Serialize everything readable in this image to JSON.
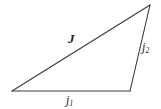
{
  "figure": {
    "kind": "geometry-diagram",
    "background_color": "#ffffff",
    "stroke_color": "#3a3a3a",
    "text_color": "#1d1d1d",
    "width": 161,
    "height": 109
  },
  "triangle": {
    "vertices": {
      "left": {
        "x": 12,
        "y": 91
      },
      "apex": {
        "x": 150,
        "y": 5
      },
      "right": {
        "x": 130,
        "y": 91
      }
    },
    "edges": [
      {
        "name": "hypotenuse",
        "from": "left",
        "to": "apex",
        "label_key": "J"
      },
      {
        "name": "base",
        "from": "left",
        "to": "right",
        "label_key": "j1"
      },
      {
        "name": "right-side",
        "from": "right",
        "to": "apex",
        "label_key": "j2"
      }
    ]
  },
  "labels": {
    "J": {
      "base": "J",
      "sub": ""
    },
    "j1": {
      "base": "j",
      "sub": "1"
    },
    "j2": {
      "base": "j",
      "sub": "2"
    }
  }
}
